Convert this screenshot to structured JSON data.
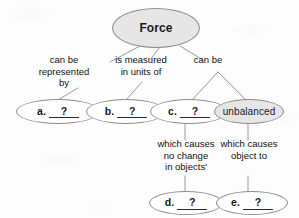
{
  "diagram": {
    "type": "concept-map",
    "title": "Force",
    "background_color": "#fdfdfd",
    "node_fill_shaded": "#e6e6e6",
    "node_fill_plain": "#ffffff",
    "node_stroke": "#8d8d8d",
    "edge_stroke": "#9a9a9a"
  },
  "nodes": {
    "root": {
      "label": "Force",
      "shaded": true
    },
    "a": {
      "letter": "a.",
      "blank": "?",
      "shaded": false
    },
    "b": {
      "letter": "b.",
      "blank": "?",
      "shaded": false
    },
    "c": {
      "letter": "c.",
      "blank": "?",
      "shaded": false
    },
    "unbalanced": {
      "label": "unbalanced",
      "shaded": true
    },
    "d": {
      "letter": "d.",
      "blank": "?",
      "shaded": false
    },
    "e": {
      "letter": "e.",
      "blank": "?",
      "shaded": false
    }
  },
  "edge_labels": {
    "represented_by": "can be\nrepresented\nby",
    "measured_in": "is measured\nin units of",
    "can_be": "can be",
    "no_change": "which causes\nno change\nin objects'",
    "object_to": "which causes\nobject to"
  }
}
